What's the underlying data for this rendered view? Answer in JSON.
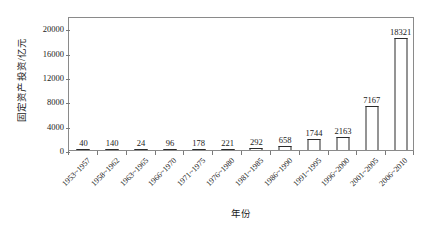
{
  "chart_data": {
    "type": "bar",
    "title": "",
    "xlabel": "年份",
    "ylabel": "固定资产投资/亿元",
    "ylim": [
      0,
      22000
    ],
    "ytick_labels": [
      "0",
      "4000",
      "8000",
      "12000",
      "16000",
      "20000"
    ],
    "ytick_values": [
      0,
      4000,
      8000,
      12000,
      16000,
      20000
    ],
    "grid": false,
    "legend": "none",
    "categories": [
      "1953~1957",
      "1958~1962",
      "1963~1965",
      "1966~1970",
      "1971~1975",
      "1976~1980",
      "1981~1985",
      "1986~1990",
      "1991~1995",
      "1996~2000",
      "2001~2005",
      "2006~2010"
    ],
    "values": [
      40,
      140,
      24,
      96,
      178,
      221,
      292,
      658,
      1744,
      2163,
      7167,
      18321
    ],
    "value_labels": [
      "40",
      "140",
      "24",
      "96",
      "178",
      "221",
      "292",
      "658",
      "1744",
      "2163",
      "7167",
      "18321"
    ],
    "bar_face_color": "#ffffff",
    "bar_edge_color": "#2b2b2b",
    "frame_color": "#8a8a8a",
    "background_color": "#ffffff"
  }
}
